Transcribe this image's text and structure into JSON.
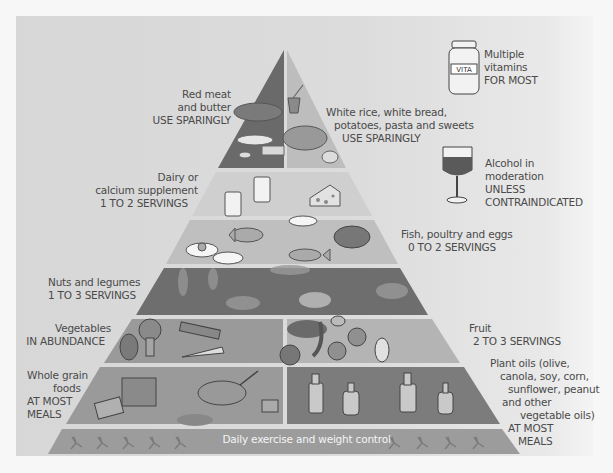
{
  "colors": {
    "background": "#f7f7f7",
    "panel": "#d9d9d9",
    "tier_dark": "#6a6a6a",
    "tier_mid": "#8e8e8e",
    "tier_light": "#bdbdbd",
    "tier_pale": "#cfcfcf",
    "divider": "#eeeeee",
    "text": "#4a4a4a"
  },
  "pyramid": {
    "tiers": [
      {
        "id": "red-meat-butter",
        "position": "top-left",
        "name": "Red meat and butter",
        "lines": [
          "Red meat",
          "and butter",
          "USE SPARINGLY"
        ],
        "icon": "steak-butter-icon"
      },
      {
        "id": "white-starches",
        "position": "top-right",
        "name": "White rice, white bread, potatoes, pasta and sweets",
        "lines": [
          "White rice, white bread,",
          "potatoes, pasta and sweets",
          "USE SPARINGLY"
        ],
        "icon": "pizza-bowl-icon"
      },
      {
        "id": "dairy",
        "position": "tier-2",
        "name": "Dairy or calcium supplement",
        "lines": [
          "Dairy or",
          "calcium supplement",
          "1 TO 2 SERVINGS"
        ],
        "icon": "milk-cheese-icon"
      },
      {
        "id": "fish-poultry-eggs",
        "position": "tier-3",
        "name": "Fish, poultry and eggs",
        "lines": [
          "Fish, poultry and eggs",
          "0 TO 2 SERVINGS"
        ],
        "icon": "fish-chicken-egg-icon"
      },
      {
        "id": "nuts-legumes",
        "position": "tier-4",
        "name": "Nuts and legumes",
        "lines": [
          "Nuts and legumes",
          "1 TO 3 SERVINGS"
        ],
        "icon": "nuts-beans-icon"
      },
      {
        "id": "vegetables",
        "position": "tier-5-left",
        "name": "Vegetables",
        "lines": [
          "Vegetables",
          "IN ABUNDANCE"
        ],
        "icon": "broccoli-carrot-icon"
      },
      {
        "id": "fruit",
        "position": "tier-5-right",
        "name": "Fruit",
        "lines": [
          "Fruit",
          "2 TO 3 SERVINGS"
        ],
        "icon": "grapes-banana-apple-icon"
      },
      {
        "id": "whole-grains",
        "position": "tier-6-left",
        "name": "Whole grain foods",
        "lines": [
          "Whole grain",
          "foods",
          "AT MOST",
          "MEALS"
        ],
        "icon": "bread-cereal-icon"
      },
      {
        "id": "plant-oils",
        "position": "tier-6-right",
        "name": "Plant oils",
        "lines": [
          "Plant oils (olive,",
          "canola, soy, corn,",
          "sunflower, peanut",
          "and other",
          "vegetable oils)",
          "AT MOST",
          "MEALS"
        ],
        "icon": "oil-bottles-icon"
      }
    ],
    "base": {
      "label": "Daily exercise and weight control",
      "icon": "running-figures-icon"
    }
  },
  "extras": {
    "vitamins": {
      "lines": [
        "Multiple",
        "vitamins",
        "FOR MOST"
      ],
      "bottle_label": "VITA",
      "icon": "vitamin-bottle-icon"
    },
    "alcohol": {
      "lines": [
        "Alcohol in",
        "moderation",
        "UNLESS",
        "CONTRAINDICATED"
      ],
      "icon": "wine-glass-icon"
    }
  },
  "oil_bottle_labels": [
    "OLIVE",
    "OIL",
    "OIL",
    "OIL"
  ]
}
